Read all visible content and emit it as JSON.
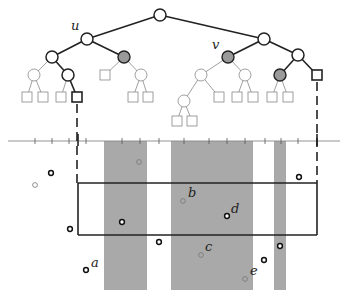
{
  "figure": {
    "node_labels": {
      "u": "u",
      "v": "v"
    },
    "point_labels": {
      "a": "a",
      "b": "b",
      "c": "c",
      "d": "d",
      "e": "e"
    },
    "colors": {
      "stroke_dark": "#222222",
      "stroke_light": "#888888",
      "selected_node_fill": "#9a9a9a",
      "slab_fill": "#a9a9a9",
      "background": "#ffffff"
    },
    "tree": {
      "nodes": [
        {
          "id": "root",
          "x": 160,
          "y": 15,
          "style": "bold"
        },
        {
          "id": "u",
          "x": 87,
          "y": 39,
          "style": "bold"
        },
        {
          "id": "r1",
          "x": 264,
          "y": 39,
          "style": "bold"
        },
        {
          "id": "u_l",
          "x": 52,
          "y": 57,
          "style": "bold"
        },
        {
          "id": "u_r",
          "x": 124,
          "y": 57,
          "style": "gray"
        },
        {
          "id": "v",
          "x": 228,
          "y": 57,
          "style": "gray"
        },
        {
          "id": "r1_r",
          "x": 298,
          "y": 55,
          "style": "bold"
        },
        {
          "id": "u_l_l",
          "x": 34,
          "y": 75,
          "style": "thin"
        },
        {
          "id": "u_l_r",
          "x": 68,
          "y": 75,
          "style": "bold"
        },
        {
          "id": "u_r_r",
          "x": 141,
          "y": 75,
          "style": "thin"
        },
        {
          "id": "v_l",
          "x": 201,
          "y": 75,
          "style": "thin"
        },
        {
          "id": "v_r",
          "x": 245,
          "y": 75,
          "style": "thin"
        },
        {
          "id": "r1_r_l",
          "x": 280,
          "y": 75,
          "style": "gray"
        },
        {
          "id": "v_l_l",
          "x": 184,
          "y": 101,
          "style": "thin"
        }
      ],
      "leaves": [
        {
          "x": 27,
          "y": 97,
          "style": "thin"
        },
        {
          "x": 43,
          "y": 97,
          "style": "thin"
        },
        {
          "x": 61,
          "y": 97,
          "style": "thin"
        },
        {
          "x": 77,
          "y": 97,
          "style": "bold"
        },
        {
          "x": 105,
          "y": 75,
          "style": "thin"
        },
        {
          "x": 133,
          "y": 97,
          "style": "thin"
        },
        {
          "x": 148,
          "y": 97,
          "style": "thin"
        },
        {
          "x": 177,
          "y": 121,
          "style": "thin"
        },
        {
          "x": 192,
          "y": 121,
          "style": "thin"
        },
        {
          "x": 219,
          "y": 97,
          "style": "thin"
        },
        {
          "x": 237,
          "y": 97,
          "style": "thin"
        },
        {
          "x": 253,
          "y": 97,
          "style": "thin"
        },
        {
          "x": 272,
          "y": 97,
          "style": "thin"
        },
        {
          "x": 288,
          "y": 97,
          "style": "thin"
        },
        {
          "x": 317,
          "y": 75,
          "style": "bold"
        }
      ]
    },
    "axis": {
      "y": 141,
      "x_start": 8,
      "x_end": 340,
      "ticks": [
        35,
        52,
        69,
        86,
        122,
        140,
        159,
        184,
        209,
        227,
        245,
        265,
        281,
        298
      ],
      "bold_ticks": [
        78,
        317
      ]
    },
    "slabs": [
      {
        "x1": 104,
        "x2": 147
      },
      {
        "x1": 171,
        "x2": 253
      },
      {
        "x1": 274,
        "x2": 286
      }
    ],
    "query_rect": {
      "x1": 78,
      "y1": 183,
      "x2": 317,
      "y2": 235
    },
    "points": [
      {
        "x": 51,
        "y": 173,
        "style": "bold"
      },
      {
        "x": 35,
        "y": 185,
        "style": "thin"
      },
      {
        "x": 139,
        "y": 162,
        "style": "thin"
      },
      {
        "x": 299,
        "y": 177,
        "style": "bold"
      },
      {
        "x": 183,
        "y": 201,
        "style": "thin",
        "label": "b"
      },
      {
        "x": 227,
        "y": 216,
        "style": "bold",
        "label": "d"
      },
      {
        "x": 122,
        "y": 222,
        "style": "bold"
      },
      {
        "x": 70,
        "y": 229,
        "style": "bold"
      },
      {
        "x": 159,
        "y": 242,
        "style": "bold"
      },
      {
        "x": 280,
        "y": 246,
        "style": "bold"
      },
      {
        "x": 201,
        "y": 255,
        "style": "thin",
        "label": "c"
      },
      {
        "x": 264,
        "y": 260,
        "style": "bold"
      },
      {
        "x": 86,
        "y": 270,
        "style": "bold",
        "label": "a"
      },
      {
        "x": 245,
        "y": 279,
        "style": "thin",
        "label": "e"
      }
    ]
  }
}
